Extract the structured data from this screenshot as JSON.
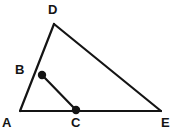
{
  "figure": {
    "background_color": "#ffffff",
    "stroke_color": "#141414",
    "label_color": "#141414",
    "stroke_width": 2.2,
    "width": 174,
    "height": 134
  },
  "points": {
    "A": {
      "label": "A",
      "x": 20,
      "y": 111,
      "marked": false,
      "label_x": 2,
      "label_y": 116
    },
    "B": {
      "label": "B",
      "x": 42,
      "y": 75,
      "marked": true,
      "label_x": 15,
      "label_y": 63
    },
    "C": {
      "label": "C",
      "x": 76,
      "y": 110,
      "marked": true,
      "label_x": 71,
      "label_y": 116
    },
    "D": {
      "label": "D",
      "x": 54,
      "y": 24,
      "marked": false,
      "label_x": 48,
      "label_y": 3
    },
    "E": {
      "label": "E",
      "x": 161,
      "y": 111,
      "marked": false,
      "label_x": 161,
      "label_y": 116
    }
  },
  "segments": [
    {
      "name": "segment-A-D",
      "from": "A",
      "to": "D"
    },
    {
      "name": "segment-D-E",
      "from": "D",
      "to": "E"
    },
    {
      "name": "segment-A-E",
      "from": "A",
      "to": "E"
    },
    {
      "name": "segment-B-C",
      "from": "B",
      "to": "C"
    }
  ],
  "dot_radius": 4.2
}
